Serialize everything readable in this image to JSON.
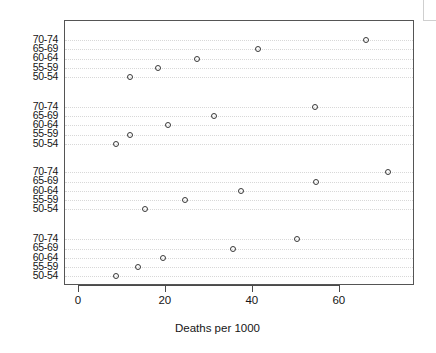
{
  "chart_data": {
    "type": "scatter",
    "title": "",
    "xlabel": "Deaths per 1000",
    "ylabel": "",
    "xlim": [
      -3.2,
      77.3
    ],
    "xticks": [
      0,
      20,
      40,
      60
    ],
    "xtick_labels": [
      "0",
      "20",
      "40",
      "60"
    ],
    "grid": true,
    "grid_style": "dotted-horizontal",
    "legend": "none",
    "marker": "open-circle",
    "marker_color": "#3a3a3a",
    "categories": [
      "70-74",
      "65-69",
      "60-64",
      "55-59",
      "50-54"
    ],
    "panel_count": 4,
    "series": [
      {
        "name": "group-1",
        "points": [
          {
            "category": "70-74",
            "value": 66.0
          },
          {
            "category": "65-69",
            "value": 41.2
          },
          {
            "category": "60-64",
            "value": 27.2
          },
          {
            "category": "55-59",
            "value": 18.2
          },
          {
            "category": "50-54",
            "value": 11.8
          }
        ]
      },
      {
        "name": "group-2",
        "points": [
          {
            "category": "70-74",
            "value": 54.4
          },
          {
            "category": "65-69",
            "value": 31.1
          },
          {
            "category": "60-64",
            "value": 20.5
          },
          {
            "category": "55-59",
            "value": 11.8
          },
          {
            "category": "50-54",
            "value": 8.6
          }
        ]
      },
      {
        "name": "group-3",
        "points": [
          {
            "category": "70-74",
            "value": 71.0
          },
          {
            "category": "65-69",
            "value": 54.6
          },
          {
            "category": "60-64",
            "value": 37.2
          },
          {
            "category": "55-59",
            "value": 24.4
          },
          {
            "category": "50-54",
            "value": 15.2
          }
        ]
      },
      {
        "name": "group-4",
        "points": [
          {
            "category": "70-74",
            "value": 50.2
          },
          {
            "category": "65-69",
            "value": 35.4
          },
          {
            "category": "60-64",
            "value": 19.4
          },
          {
            "category": "55-59",
            "value": 13.7
          },
          {
            "category": "50-54",
            "value": 8.5
          }
        ]
      }
    ]
  },
  "axis": {
    "x_title": "Deaths per 1000",
    "x_tick_labels": [
      "0",
      "20",
      "40",
      "60"
    ],
    "y_tick_labels": [
      "70-74",
      "65-69",
      "60-64",
      "55-59",
      "50-54",
      "70-74",
      "65-69",
      "60-64",
      "55-59",
      "50-54",
      "70-74",
      "65-69",
      "60-64",
      "55-59",
      "50-54",
      "70-74",
      "65-69",
      "60-64",
      "55-59",
      "50-54"
    ]
  },
  "colors": {
    "marker": "#3a3a3a",
    "panel_border": "#555555",
    "gridline": "#d8d8d8",
    "text": "#161616",
    "background": "#ffffff"
  }
}
